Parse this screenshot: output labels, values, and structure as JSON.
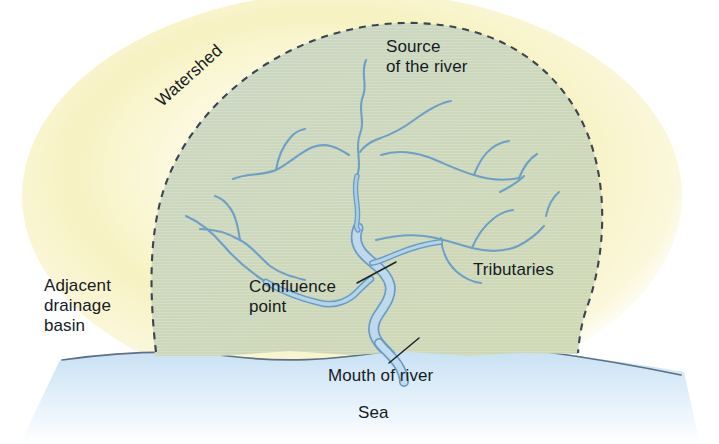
{
  "diagram": {
    "type": "labelled-illustration",
    "canvas": {
      "width": 719,
      "height": 444
    },
    "colors": {
      "background": "#ffffff",
      "basin_fill": "#ccd6bb",
      "glow_fill": "#f7f3c6",
      "sea_fill": "#cfe4f5",
      "sea_fill_fade": "#ffffff",
      "watershed_border": "#3a4550",
      "coastline": "#5c7086",
      "river_main_fill": "#bdd8ec",
      "river_main_stroke": "#6b9cc4",
      "tributary_stroke": "#6f9fc6",
      "label_text": "#151b1f",
      "leader_line": "#1d2328"
    },
    "labels": {
      "watershed": "Watershed",
      "source": "Source\nof the river",
      "adjacent": "Adjacent\ndrainage\nbasin",
      "confluence": "Confluence\npoint",
      "tributaries": "Tributaries",
      "mouth": "Mouth of river",
      "sea": "Sea"
    },
    "leader_lines": [
      {
        "name": "confluence-leader",
        "from": [
          357,
          283
        ],
        "to": [
          395,
          262
        ]
      },
      {
        "name": "mouth-leader",
        "from": [
          390,
          363
        ],
        "to": [
          420,
          338
        ]
      }
    ],
    "regions": [
      {
        "name": "drainage-basin",
        "label": "Watershed"
      },
      {
        "name": "adjacent-drainage-basin",
        "label": "Adjacent drainage basin"
      },
      {
        "name": "sea",
        "label": "Sea"
      }
    ],
    "features": [
      {
        "name": "source-of-the-river",
        "label": "Source of the river"
      },
      {
        "name": "confluence-point",
        "label": "Confluence point"
      },
      {
        "name": "tributaries",
        "label": "Tributaries"
      },
      {
        "name": "mouth-of-river",
        "label": "Mouth of river"
      }
    ]
  }
}
